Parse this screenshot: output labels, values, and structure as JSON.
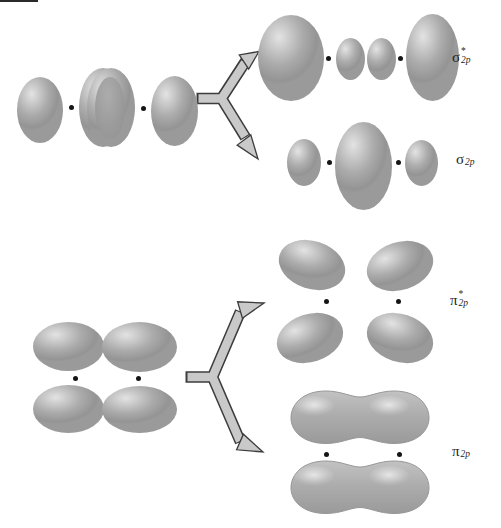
{
  "labels": {
    "sigma_star_2p": {
      "base": "σ",
      "sup": "*",
      "sub": "2p"
    },
    "sigma_2p": {
      "base": "σ",
      "sup": "",
      "sub": "2p"
    },
    "pi_star_2p": {
      "base": "π",
      "sup": "*",
      "sub": "2p"
    },
    "pi_2p": {
      "base": "π",
      "sup": "",
      "sub": "2p"
    }
  },
  "colors": {
    "background": "#ffffff",
    "lobe_highlight": "#e3e3e3",
    "lobe_mid": "#ababab",
    "lobe_edge": "#949494",
    "overlap_shade": "#8f8f8f",
    "nucleus_dot": "#151515",
    "arrow_fill": "#c9c9c9",
    "arrow_outline": "#3c3c3c",
    "artifact_line": "#2a2a2a"
  }
}
